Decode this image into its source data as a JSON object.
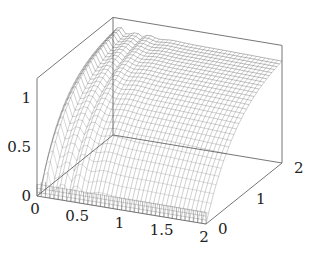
{
  "chart_data": {
    "type": "surface",
    "title": "",
    "xlabel": "",
    "ylabel": "",
    "zlabel": "",
    "x_range": [
      0,
      2
    ],
    "y_range": [
      0,
      2
    ],
    "z_range": [
      0,
      1.2
    ],
    "x_ticks": [
      0,
      0.5,
      1,
      1.5,
      2
    ],
    "x_tick_labels": [
      "0",
      "0.5",
      "1",
      "1.5",
      "2"
    ],
    "y_ticks": [
      0,
      1,
      2
    ],
    "y_tick_labels": [
      "0",
      "1",
      "2"
    ],
    "z_ticks": [
      0,
      0.5,
      1
    ],
    "z_tick_labels": [
      "0",
      "0.5",
      "1"
    ],
    "grid": false,
    "style": "mesh with front skirt",
    "mesh_resolution": [
      40,
      30
    ],
    "colors": {
      "mesh": "#555555",
      "box": "#777777",
      "text": "#222222"
    }
  },
  "projection": {
    "origin": [
      37,
      196
    ],
    "x_unit": [
      84.5,
      14
    ],
    "y_unit": [
      38,
      -30.5
    ],
    "z_unit": [
      0,
      -98
    ]
  }
}
